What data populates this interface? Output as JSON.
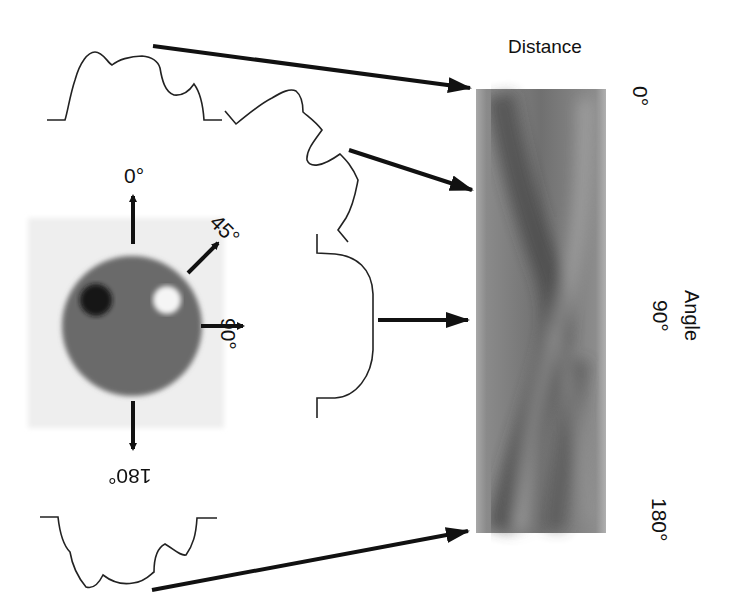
{
  "phantom": {
    "angle_labels": [
      "0°",
      "45°",
      "90°",
      "180°"
    ],
    "colors": {
      "background": "#f0f0f0",
      "disk": "#6a6a6a",
      "dark_spot": "#121212",
      "light_spot": "#f5f5f5"
    }
  },
  "sinogram": {
    "distance_label": "Distance",
    "angle_label": "Angle",
    "angle_ticks": [
      "0°",
      "90°",
      "180°"
    ]
  },
  "projections": [
    "0°",
    "45°",
    "90°",
    "180°"
  ]
}
